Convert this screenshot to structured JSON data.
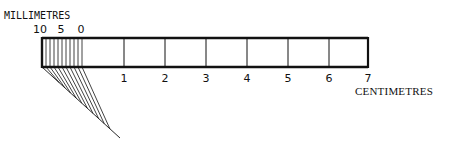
{
  "diagram": {
    "title_top": "MILLIMETRES",
    "title_bottom": "CENTIMETRES",
    "mm_labels": [
      {
        "text": "10",
        "x": 40
      },
      {
        "text": "5",
        "x": 61
      },
      {
        "text": "0",
        "x": 81
      }
    ],
    "cm_labels": [
      {
        "text": "1",
        "x": 124
      },
      {
        "text": "2",
        "x": 165
      },
      {
        "text": "3",
        "x": 206
      },
      {
        "text": "4",
        "x": 247
      },
      {
        "text": "5",
        "x": 288
      },
      {
        "text": "6",
        "x": 329
      },
      {
        "text": "7",
        "x": 368
      }
    ],
    "ruler": {
      "x0": 42,
      "x1": 368,
      "y0": 38,
      "y1": 67
    },
    "mm_region": {
      "x0": 42,
      "x1": 82,
      "divisions": 10
    },
    "cm_ticks_x": [
      124,
      165,
      206,
      247,
      288,
      329
    ],
    "diagonal": {
      "apex_x": 42,
      "apex_y": 67,
      "end_x": 120,
      "end_y": 138,
      "fan_lines": 10
    },
    "stroke_color": "#111111"
  }
}
